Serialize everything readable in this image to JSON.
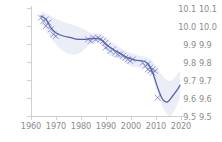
{
  "figure": {
    "background_color": "#ffffff",
    "axis_color": "#cfcfcf",
    "tick_label_color": "#8c8c8c"
  },
  "chart_data": {
    "type": "scatter",
    "title": "",
    "subtitle": "",
    "xlabel": "",
    "ylabel": "",
    "xlim": [
      1960,
      2022
    ],
    "ylim": [
      9.47,
      10.13
    ],
    "grid": false,
    "legend": null,
    "marker_symbol": "x",
    "marker_color": "#7b82c4",
    "line_color": "#5560ae",
    "band_color": "#e8eaf6",
    "band_label": "confidence band",
    "xticks": [
      1960,
      1970,
      1980,
      1990,
      2000,
      2010,
      2020
    ],
    "xtick_labels": [
      "1960",
      "1970",
      "1980",
      "1990",
      "2000",
      "2010",
      "2020"
    ],
    "yticks": [
      9.5,
      9.6,
      9.7,
      9.8,
      9.9,
      10.0,
      10.1
    ],
    "ytick_labels": [
      "9.5",
      "9.6",
      "9.7",
      "9.8",
      "9.9",
      "10.0",
      "10.1"
    ],
    "scatter_points": [
      {
        "x": 1964,
        "y": 10.06
      },
      {
        "x": 1965,
        "y": 10.04
      },
      {
        "x": 1966,
        "y": 10.05
      },
      {
        "x": 1966,
        "y": 10.01
      },
      {
        "x": 1967,
        "y": 10.03
      },
      {
        "x": 1968,
        "y": 9.99
      },
      {
        "x": 1969,
        "y": 9.96
      },
      {
        "x": 1970,
        "y": 9.95
      },
      {
        "x": 1983,
        "y": 9.93
      },
      {
        "x": 1984,
        "y": 9.92
      },
      {
        "x": 1985,
        "y": 9.94
      },
      {
        "x": 1986,
        "y": 9.93
      },
      {
        "x": 1987,
        "y": 9.94
      },
      {
        "x": 1988,
        "y": 9.93
      },
      {
        "x": 1989,
        "y": 9.92
      },
      {
        "x": 1990,
        "y": 9.91
      },
      {
        "x": 1990,
        "y": 9.88
      },
      {
        "x": 1991,
        "y": 9.89
      },
      {
        "x": 1992,
        "y": 9.86
      },
      {
        "x": 1993,
        "y": 9.87
      },
      {
        "x": 1994,
        "y": 9.85
      },
      {
        "x": 1995,
        "y": 9.84
      },
      {
        "x": 1996,
        "y": 9.84
      },
      {
        "x": 1997,
        "y": 9.83
      },
      {
        "x": 1998,
        "y": 9.82
      },
      {
        "x": 1999,
        "y": 9.81
      },
      {
        "x": 2000,
        "y": 9.8
      },
      {
        "x": 2001,
        "y": 9.81
      },
      {
        "x": 2005,
        "y": 9.79
      },
      {
        "x": 2006,
        "y": 9.77
      },
      {
        "x": 2007,
        "y": 9.78
      },
      {
        "x": 2007,
        "y": 9.75
      },
      {
        "x": 2008,
        "y": 9.76
      },
      {
        "x": 2008,
        "y": 9.74
      },
      {
        "x": 2009,
        "y": 9.75
      },
      {
        "x": 2009,
        "y": 9.73
      },
      {
        "x": 2010,
        "y": 9.74
      },
      {
        "x": 2011,
        "y": 9.58
      }
    ],
    "trend_line": [
      {
        "x": 1964,
        "y": 10.07
      },
      {
        "x": 1966,
        "y": 10.05
      },
      {
        "x": 1968,
        "y": 10.0
      },
      {
        "x": 1970,
        "y": 9.97
      },
      {
        "x": 1973,
        "y": 9.95
      },
      {
        "x": 1976,
        "y": 9.94
      },
      {
        "x": 1979,
        "y": 9.93
      },
      {
        "x": 1982,
        "y": 9.93
      },
      {
        "x": 1985,
        "y": 9.935
      },
      {
        "x": 1988,
        "y": 9.93
      },
      {
        "x": 1990,
        "y": 9.9
      },
      {
        "x": 1993,
        "y": 9.87
      },
      {
        "x": 1996,
        "y": 9.845
      },
      {
        "x": 1999,
        "y": 9.82
      },
      {
        "x": 2002,
        "y": 9.805
      },
      {
        "x": 2005,
        "y": 9.8
      },
      {
        "x": 2007,
        "y": 9.785
      },
      {
        "x": 2009,
        "y": 9.73
      },
      {
        "x": 2011,
        "y": 9.64
      },
      {
        "x": 2013,
        "y": 9.57
      },
      {
        "x": 2015,
        "y": 9.555
      },
      {
        "x": 2017,
        "y": 9.59
      },
      {
        "x": 2019,
        "y": 9.63
      },
      {
        "x": 2020,
        "y": 9.655
      }
    ],
    "band_upper": [
      {
        "x": 1964,
        "y": 10.1
      },
      {
        "x": 1968,
        "y": 10.07
      },
      {
        "x": 1972,
        "y": 10.04
      },
      {
        "x": 1976,
        "y": 10.02
      },
      {
        "x": 1980,
        "y": 10.0
      },
      {
        "x": 1984,
        "y": 9.97
      },
      {
        "x": 1988,
        "y": 9.96
      },
      {
        "x": 1992,
        "y": 9.92
      },
      {
        "x": 1996,
        "y": 9.88
      },
      {
        "x": 2000,
        "y": 9.85
      },
      {
        "x": 2004,
        "y": 9.83
      },
      {
        "x": 2008,
        "y": 9.81
      },
      {
        "x": 2012,
        "y": 9.73
      },
      {
        "x": 2016,
        "y": 9.68
      },
      {
        "x": 2020,
        "y": 9.74
      }
    ],
    "band_lower": [
      {
        "x": 1964,
        "y": 10.03
      },
      {
        "x": 1968,
        "y": 9.94
      },
      {
        "x": 1972,
        "y": 9.87
      },
      {
        "x": 1976,
        "y": 9.84
      },
      {
        "x": 1980,
        "y": 9.85
      },
      {
        "x": 1984,
        "y": 9.9
      },
      {
        "x": 1988,
        "y": 9.9
      },
      {
        "x": 1992,
        "y": 9.83
      },
      {
        "x": 1996,
        "y": 9.81
      },
      {
        "x": 2000,
        "y": 9.77
      },
      {
        "x": 2004,
        "y": 9.76
      },
      {
        "x": 2008,
        "y": 9.74
      },
      {
        "x": 2012,
        "y": 9.56
      },
      {
        "x": 2016,
        "y": 9.47
      },
      {
        "x": 2020,
        "y": 9.58
      }
    ]
  },
  "adjacent_panel": {
    "ytick_labels": [
      "10.1",
      "10.0",
      "9.9",
      "9.8",
      "9.7",
      "9.6",
      "9.5"
    ],
    "clipped": "true"
  }
}
